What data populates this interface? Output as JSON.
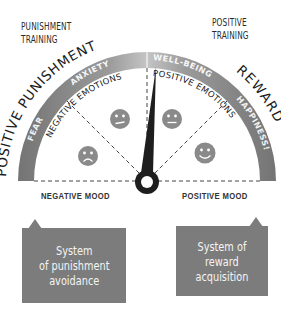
{
  "corners": {
    "punishment_training": "PUNISHMENT\nTRAINING",
    "punishment_line1": "PUNISHMENT",
    "punishment_line2": "TRAINING",
    "positive_line1": "POSITIVE",
    "positive_line2": "TRAINING"
  },
  "arc_titles": {
    "left": "POSITIVE PUNISHMENT",
    "right": "REWARD"
  },
  "band_segments": [
    {
      "label": "FEAR",
      "color": "#7a7a7a"
    },
    {
      "label": "ANXIETY",
      "color": "#b4b4b4"
    },
    {
      "label": "WELL-BEING",
      "color": "#b4b4b4"
    },
    {
      "label": "HAPPINESS!",
      "color": "#7a7a7a"
    }
  ],
  "inner_labels": {
    "left": "NEGATIVE EMOTIONS",
    "right": "POSITIVE EMOTIONS"
  },
  "faces": [
    "sad-face",
    "neutral-face",
    "neutral-face",
    "happy-face"
  ],
  "moods": {
    "negative": "NEGATIVE MOOD",
    "positive": "POSITIVE MOOD"
  },
  "systems": {
    "left": "System\nof punishment\navoidance",
    "right": "System of\nreward\nacquisition"
  },
  "colors": {
    "band_dark": "#7a7a7a",
    "band_light": "#b8b8b8",
    "needle": "#1e1e1e",
    "box": "#7c7c7c",
    "face": "#8a8a8a"
  },
  "needle": {
    "angle_deg_from_vertical": 6
  }
}
